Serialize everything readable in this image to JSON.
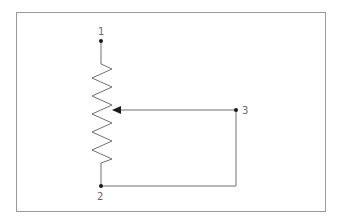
{
  "diagram": {
    "colors": {
      "frame": "#9a9a9a",
      "wire": "#707070",
      "node": "#1a1a1a",
      "label": "#6a6a6a"
    },
    "nodes": [
      {
        "id": "1",
        "label": "1",
        "x": 101,
        "y": 41
      },
      {
        "id": "2",
        "label": "2",
        "x": 101,
        "y": 186
      },
      {
        "id": "3",
        "label": "3",
        "x": 236,
        "y": 110
      }
    ],
    "components": [
      {
        "type": "resistor",
        "from": "1",
        "to": "2",
        "wiper": "3"
      }
    ],
    "connections": [
      {
        "from": "3",
        "to": "2",
        "note": "wiper shorted to terminal 2"
      }
    ]
  }
}
